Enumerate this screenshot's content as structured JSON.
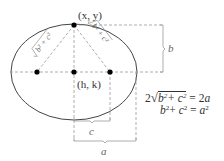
{
  "diagram": {
    "type": "ellipse-foci-derivation",
    "labels": {
      "top_point": "(x, y)",
      "center": "(h, k)",
      "brace_b": "b",
      "brace_c": "c",
      "brace_a": "a",
      "left_segment": "√(b² + c²)",
      "right_segment": "√(b² + c²)"
    },
    "equations": [
      "2√(b² + c²) = 2a",
      "b² + c² = a²"
    ],
    "colors": {
      "curve": "#444444",
      "dashed": "#999999",
      "points": "#000000",
      "text": "#333333"
    }
  }
}
